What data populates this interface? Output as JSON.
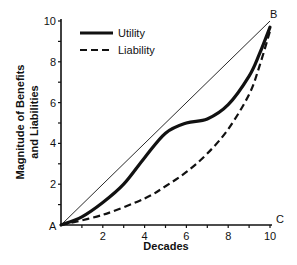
{
  "chart_data": {
    "type": "line",
    "title": "",
    "xlabel": "Decades",
    "ylabel": [
      "Magnitude of Benefits",
      "and Liabilities"
    ],
    "xlim": [
      0,
      10
    ],
    "ylim": [
      0,
      10
    ],
    "x_ticks": [
      2,
      4,
      6,
      8,
      10
    ],
    "y_ticks": [
      2,
      4,
      6,
      8,
      10
    ],
    "grid": false,
    "legend_position": "upper-left",
    "corner_labels": {
      "origin": "A",
      "top_right": "B",
      "bottom_right": "C"
    },
    "series": [
      {
        "name": "Utility",
        "style": "solid-thick",
        "x": [
          0,
          1,
          2,
          3,
          4,
          5,
          6,
          7,
          8,
          9,
          9.5,
          10
        ],
        "y": [
          0,
          0.4,
          1.1,
          2.0,
          3.3,
          4.5,
          5.0,
          5.2,
          5.9,
          7.3,
          8.4,
          9.7
        ]
      },
      {
        "name": "Liability",
        "style": "dashed",
        "x": [
          0,
          2,
          4,
          5,
          6,
          7,
          8,
          9,
          9.5,
          10
        ],
        "y": [
          0,
          0.5,
          1.3,
          1.9,
          2.6,
          3.5,
          4.7,
          6.4,
          7.8,
          9.5
        ]
      },
      {
        "name": "Reference diagonal (A-B)",
        "style": "solid-thin",
        "x": [
          0,
          10
        ],
        "y": [
          0,
          10
        ]
      }
    ]
  },
  "legend": {
    "items": [
      {
        "label": "Utility"
      },
      {
        "label": "Liability"
      }
    ]
  }
}
